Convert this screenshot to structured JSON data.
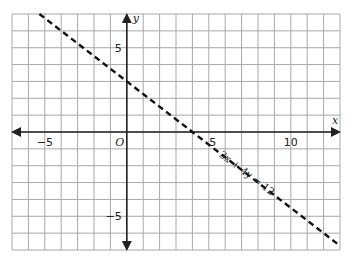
{
  "chart_data": {
    "type": "line",
    "title": "",
    "xlabel": "x",
    "ylabel": "y",
    "origin_label": "O",
    "xlim": [
      -7,
      13
    ],
    "ylim": [
      -7,
      7
    ],
    "grid": true,
    "x_ticks": [
      {
        "value": -5,
        "label": "−5"
      },
      {
        "value": 5,
        "label": "5"
      },
      {
        "value": 10,
        "label": "10"
      }
    ],
    "y_ticks": [
      {
        "value": 5,
        "label": "5"
      },
      {
        "value": -5,
        "label": "−5"
      }
    ],
    "series": [
      {
        "name": "3x + 4y = 12",
        "style": "dashed",
        "color": "#111111",
        "equation": {
          "a": 3,
          "b": 4,
          "c": 12
        },
        "x": [
          -5.33,
          13
        ],
        "y": [
          7,
          -6.75
        ]
      }
    ],
    "annotations": [
      {
        "text": "3x + 4y = 12",
        "x": 7.2,
        "y": -2.6,
        "rotation_deg": 37
      }
    ],
    "colors": {
      "grid": "#a8a8a8",
      "axis": "#222222",
      "line": "#111111"
    }
  }
}
